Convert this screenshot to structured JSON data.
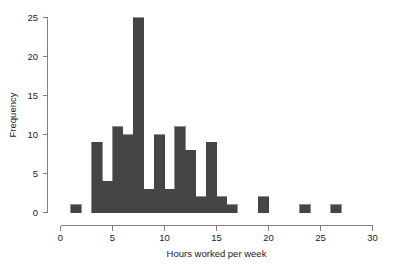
{
  "chart_data": {
    "type": "bar",
    "title": "",
    "subtitle": "",
    "xlabel": "Hours worked per week",
    "ylabel": "Frequency",
    "xlim": [
      0,
      30
    ],
    "ylim": [
      0,
      25
    ],
    "xticks": [
      0,
      5,
      10,
      15,
      20,
      25,
      30
    ],
    "yticks": [
      0,
      5,
      10,
      15,
      20,
      25
    ],
    "xtick_labels": [
      "0",
      "5",
      "10",
      "15",
      "20",
      "25",
      "30"
    ],
    "ytick_labels": [
      "0",
      "5",
      "10",
      "15",
      "20",
      "25"
    ],
    "grid": false,
    "legend": null,
    "bin_width": 1,
    "bar_color": "#454545",
    "bar_edge_color": "#454545",
    "categories": [
      "1-2",
      "2-3",
      "3-4",
      "4-5",
      "5-6",
      "6-7",
      "7-8",
      "8-9",
      "9-10",
      "10-11",
      "11-12",
      "12-13",
      "13-14",
      "14-15",
      "15-16",
      "16-17",
      "17-18",
      "18-19",
      "19-20",
      "20-21",
      "21-22",
      "22-23",
      "23-24",
      "24-25",
      "25-26",
      "26-27",
      "27-28",
      "28-29",
      "29-30"
    ],
    "bin_starts": [
      1,
      2,
      3,
      4,
      5,
      6,
      7,
      8,
      9,
      10,
      11,
      12,
      13,
      14,
      15,
      16,
      17,
      18,
      19,
      20,
      21,
      22,
      23,
      24,
      25,
      26,
      27,
      28,
      29
    ],
    "values": [
      1,
      0,
      9,
      4,
      11,
      10,
      25,
      3,
      10,
      3,
      11,
      8,
      2,
      9,
      2,
      1,
      0,
      0,
      2,
      0,
      0,
      0,
      1,
      0,
      0,
      1,
      0,
      0,
      0
    ]
  },
  "axes": {
    "x_axis_name": "Hours worked per week",
    "y_axis_name": "Frequency"
  }
}
